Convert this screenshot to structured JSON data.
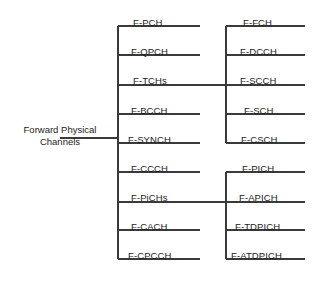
{
  "diagram": {
    "type": "tree-diagram",
    "line_color": "#3a3a3a",
    "text_color": "#1d1d1d",
    "root": {
      "line1": "Forward Physical",
      "line2": "Channels"
    },
    "level1": [
      {
        "label": "F-PCH",
        "x": 133,
        "y": 17,
        "line_y": 26,
        "line_x1": 118,
        "line_x2": 200
      },
      {
        "label": "F-QPCH",
        "x": 131,
        "y": 46,
        "line_y": 55,
        "line_x1": 118,
        "line_x2": 200
      },
      {
        "label": "F-TCHs",
        "x": 133,
        "y": 75,
        "line_y": 85,
        "line_x1": 118,
        "line_x2": 226
      },
      {
        "label": "F-BCCH",
        "x": 131,
        "y": 105,
        "line_y": 114,
        "line_x1": 118,
        "line_x2": 200
      },
      {
        "label": "F-SYNCH",
        "x": 128,
        "y": 134,
        "line_y": 143,
        "line_x1": 118,
        "line_x2": 200
      },
      {
        "label": "F-CCCH",
        "x": 131,
        "y": 163,
        "line_y": 172,
        "line_x1": 118,
        "line_x2": 200
      },
      {
        "label": "F-PiCHs",
        "x": 131,
        "y": 192,
        "line_y": 202,
        "line_x1": 118,
        "line_x2": 226
      },
      {
        "label": "F-CACH",
        "x": 131,
        "y": 221,
        "line_y": 230,
        "line_x1": 118,
        "line_x2": 200
      },
      {
        "label": "F-CPCCH",
        "x": 128,
        "y": 250,
        "line_y": 259,
        "line_x1": 118,
        "line_x2": 200
      }
    ],
    "level2_tchs": [
      {
        "label": "F-FCH",
        "x": 243,
        "y": 17,
        "line_y": 26,
        "line_x1": 226,
        "line_x2": 305
      },
      {
        "label": "F-DCCH",
        "x": 240,
        "y": 46,
        "line_y": 55,
        "line_x1": 226,
        "line_x2": 305
      },
      {
        "label": "F-SCCH",
        "x": 240,
        "y": 75,
        "line_y": 85,
        "line_x1": 226,
        "line_x2": 305
      },
      {
        "label": "F-SCH",
        "x": 244,
        "y": 105,
        "line_y": 114,
        "line_x1": 226,
        "line_x2": 305
      },
      {
        "label": "F-CSCH",
        "x": 241,
        "y": 134,
        "line_y": 143,
        "line_x1": 226,
        "line_x2": 305
      }
    ],
    "level2_pichs": [
      {
        "label": "F-PICH",
        "x": 242,
        "y": 163,
        "line_y": 172,
        "line_x1": 226,
        "line_x2": 305
      },
      {
        "label": "F-APICH",
        "x": 239,
        "y": 192,
        "line_y": 202,
        "line_x1": 226,
        "line_x2": 305
      },
      {
        "label": "F-TDPICH",
        "x": 235,
        "y": 221,
        "line_y": 230,
        "line_x1": 226,
        "line_x2": 305
      },
      {
        "label": "F-ATDPICH",
        "x": 231,
        "y": 250,
        "line_y": 259,
        "line_x1": 226,
        "line_x2": 305
      }
    ],
    "trunks": {
      "left": {
        "x": 118,
        "y1": 26,
        "y2": 259
      },
      "right_tchs": {
        "x": 226,
        "y1": 26,
        "y2": 143
      },
      "right_pichs": {
        "x": 226,
        "y1": 172,
        "y2": 259
      },
      "root_connector": {
        "x1": 60,
        "x2": 118,
        "y": 138
      }
    }
  }
}
